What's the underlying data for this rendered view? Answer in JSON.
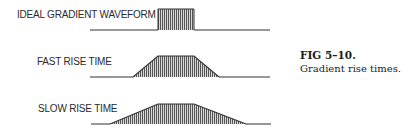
{
  "waveforms": [
    {
      "label": "IDEAL GRADIENT WAVEFORM",
      "type": "ideal",
      "rise_time": "instant"
    },
    {
      "label": "FAST RISE TIME",
      "type": "fast",
      "rise_time": "fast"
    },
    {
      "label": "SLOW RISE TIME",
      "type": "slow",
      "rise_time": "slow"
    }
  ],
  "caption": {
    "figure_number": "FIG 5–10.",
    "text": "Gradient rise times."
  },
  "colors": {
    "line": "#333333",
    "hatch": "#555555"
  }
}
